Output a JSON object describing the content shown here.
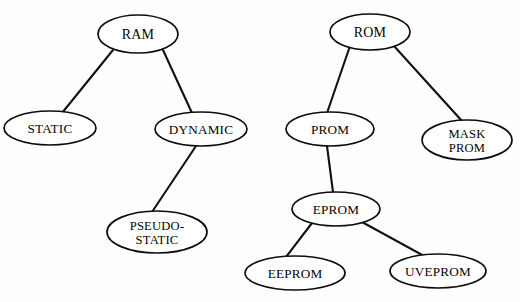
{
  "diagram": {
    "type": "tree-diagram",
    "background_color": "#fefefe",
    "line_color": "#111111",
    "node_fill_color": "#ffffff",
    "node_stroke_color": "#0d0d0d",
    "text_color": "#050505",
    "nodes": [
      {
        "id": "ram",
        "label": "RAM",
        "lines": [
          "RAM"
        ],
        "cx": 138,
        "cy": 34,
        "rx": 40,
        "ry": 19,
        "size": "lg"
      },
      {
        "id": "static",
        "label": "STATIC",
        "lines": [
          "STATIC"
        ],
        "cx": 50,
        "cy": 128,
        "rx": 46,
        "ry": 17,
        "size": "md"
      },
      {
        "id": "dynamic",
        "label": "DYNAMIC",
        "lines": [
          "DYNAMIC"
        ],
        "cx": 201,
        "cy": 129,
        "rx": 46,
        "ry": 17,
        "size": "md"
      },
      {
        "id": "pseudo-static",
        "label": "PSEUDO-STATIC",
        "lines": [
          "PSEUDO-",
          "STATIC"
        ],
        "cx": 157,
        "cy": 232,
        "rx": 50,
        "ry": 21,
        "size": "sm"
      },
      {
        "id": "rom",
        "label": "ROM",
        "lines": [
          "ROM"
        ],
        "cx": 370,
        "cy": 32,
        "rx": 40,
        "ry": 18,
        "size": "lg"
      },
      {
        "id": "prom",
        "label": "PROM",
        "lines": [
          "PROM"
        ],
        "cx": 330,
        "cy": 129,
        "rx": 44,
        "ry": 17,
        "size": "md"
      },
      {
        "id": "mask-prom",
        "label": "MASK PROM",
        "lines": [
          "MASK",
          "PROM"
        ],
        "cx": 467,
        "cy": 140,
        "rx": 45,
        "ry": 20,
        "size": "sm"
      },
      {
        "id": "eprom",
        "label": "EPROM",
        "lines": [
          "EPROM"
        ],
        "cx": 336,
        "cy": 209,
        "rx": 44,
        "ry": 17,
        "size": "md"
      },
      {
        "id": "eeprom",
        "label": "EEPROM",
        "lines": [
          "EEPROM"
        ],
        "cx": 295,
        "cy": 273,
        "rx": 50,
        "ry": 17,
        "size": "md"
      },
      {
        "id": "uveprom",
        "label": "UVEPROM",
        "lines": [
          "UVEPROM"
        ],
        "cx": 438,
        "cy": 271,
        "rx": 48,
        "ry": 17,
        "size": "md"
      }
    ],
    "edges": [
      {
        "id": "ram-static",
        "from": "RAM",
        "to": "STATIC",
        "x1": 113,
        "y1": 50,
        "x2": 62,
        "y2": 113
      },
      {
        "id": "ram-dynamic",
        "from": "RAM",
        "to": "DYNAMIC",
        "x1": 163,
        "y1": 50,
        "x2": 192,
        "y2": 113
      },
      {
        "id": "dynamic-pseudo",
        "from": "DYNAMIC",
        "to": "PSEUDO-STATIC",
        "x1": 196,
        "y1": 146,
        "x2": 152,
        "y2": 212
      },
      {
        "id": "rom-prom",
        "from": "ROM",
        "to": "PROM",
        "x1": 350,
        "y1": 46,
        "x2": 327,
        "y2": 113
      },
      {
        "id": "rom-mask-prom",
        "from": "ROM",
        "to": "MASK PROM",
        "x1": 394,
        "y1": 46,
        "x2": 462,
        "y2": 121
      },
      {
        "id": "prom-eprom",
        "from": "PROM",
        "to": "EPROM",
        "x1": 327,
        "y1": 146,
        "x2": 333,
        "y2": 192
      },
      {
        "id": "eprom-eeprom",
        "from": "EPROM",
        "to": "EEPROM",
        "x1": 312,
        "y1": 223,
        "x2": 286,
        "y2": 257
      },
      {
        "id": "eprom-uveprom",
        "from": "EPROM",
        "to": "UVEPROM",
        "x1": 362,
        "y1": 222,
        "x2": 424,
        "y2": 256
      }
    ]
  }
}
